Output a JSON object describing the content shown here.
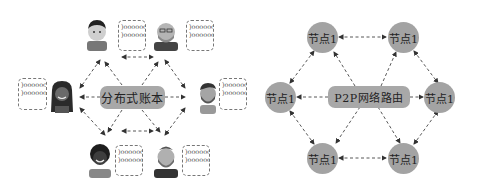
{
  "left_diagram": {
    "center_label": "分布式账本",
    "participants": [
      {
        "id": "top-left",
        "ledger_lines": [
          ")oooooc",
          ")oooooo("
        ]
      },
      {
        "id": "top-right",
        "ledger_lines": [
          ")oooooc",
          ")oooooo("
        ]
      },
      {
        "id": "left",
        "ledger_lines": [
          ")oooooc",
          ")oooooo("
        ]
      },
      {
        "id": "right",
        "ledger_lines": [
          ")oooooc",
          ")oooooo("
        ]
      },
      {
        "id": "bottom-left",
        "ledger_lines": [
          ")oooooc",
          ")oooooo("
        ]
      },
      {
        "id": "bottom-right",
        "ledger_lines": [
          ")oooooc",
          ")oooooo("
        ]
      }
    ]
  },
  "right_diagram": {
    "center_label": "P2P网络路由",
    "nodes": [
      {
        "id": "top-left",
        "label": "节点1"
      },
      {
        "id": "top-right",
        "label": "节点1"
      },
      {
        "id": "left",
        "label": "节点1"
      },
      {
        "id": "right",
        "label": "节点1"
      },
      {
        "id": "bottom-left",
        "label": "节点1"
      },
      {
        "id": "bottom-right",
        "label": "节点1"
      }
    ]
  },
  "colors": {
    "label_fill": "#a8a8a8",
    "node_fill": "#a3a3a3",
    "arrow": "#333333",
    "doc_border": "#777777"
  }
}
